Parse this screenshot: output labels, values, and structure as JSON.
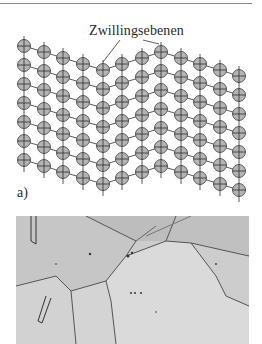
{
  "figure": {
    "annotation_label": "Zwillingsebenen",
    "panel_label": "a)"
  },
  "lattice": {
    "columns_x": [
      24,
      44,
      63,
      83,
      103,
      122,
      142,
      161,
      181,
      200,
      220,
      239
    ],
    "first_row_y": [
      46,
      52,
      58,
      64,
      70,
      64,
      58,
      52,
      58,
      64,
      70,
      76
    ],
    "row_count": 7,
    "row_spacing": 19,
    "atom_radius": 6.5,
    "twin_plane_columns": [
      4,
      7
    ],
    "colors": {
      "atom_fill": "#b4b4b4",
      "atom_stroke": "#3a3a3a",
      "line": "#2e2e2e"
    }
  },
  "micrograph": {
    "description": "optical micrograph with annealing twins",
    "background": "#c9c9c9"
  }
}
